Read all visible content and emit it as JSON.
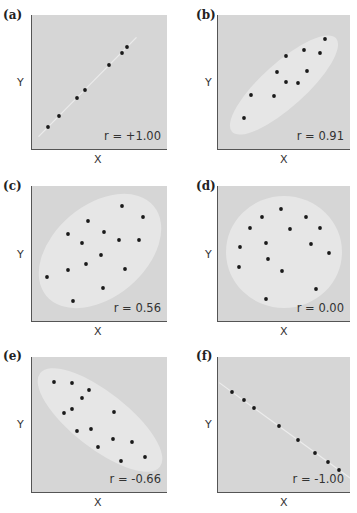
{
  "figure": {
    "colors": {
      "plot_bg": "#d6d6d6",
      "envelope": "#e6e6e6",
      "dot": "#1a1a1a",
      "axis": "#555555"
    },
    "axis_labels": {
      "x": "X",
      "y": "Y"
    }
  },
  "chart_data": [
    {
      "type": "scatter",
      "panel": "(a)",
      "annotation": "r = +1.00",
      "r": 1.0,
      "xlabel": "X",
      "ylabel": "Y",
      "envelope": "line",
      "points": [
        [
          16,
          22
        ],
        [
          27,
          33
        ],
        [
          45,
          51
        ],
        [
          53,
          59
        ],
        [
          77,
          84
        ],
        [
          90,
          96
        ],
        [
          95,
          102
        ]
      ]
    },
    {
      "type": "scatter",
      "panel": "(b)",
      "annotation": "r = 0.91",
      "r": 0.91,
      "xlabel": "X",
      "ylabel": "Y",
      "envelope": "narrow-ellipse",
      "points": [
        [
          26,
          31
        ],
        [
          33,
          54
        ],
        [
          56,
          53
        ],
        [
          59,
          77
        ],
        [
          68,
          93
        ],
        [
          68,
          67
        ],
        [
          80,
          66
        ],
        [
          86,
          99
        ],
        [
          89,
          78
        ],
        [
          102,
          96
        ],
        [
          107,
          110
        ]
      ]
    },
    {
      "type": "scatter",
      "panel": "(c)",
      "annotation": "r = 0.56",
      "r": 0.56,
      "xlabel": "X",
      "ylabel": "Y",
      "envelope": "wide-ellipse",
      "points": [
        [
          15,
          44
        ],
        [
          36,
          87
        ],
        [
          36,
          51
        ],
        [
          41,
          20
        ],
        [
          50,
          78
        ],
        [
          56,
          100
        ],
        [
          54,
          57
        ],
        [
          69,
          66
        ],
        [
          72,
          89
        ],
        [
          71,
          33
        ],
        [
          87,
          81
        ],
        [
          90,
          115
        ],
        [
          93,
          52
        ],
        [
          107,
          81
        ],
        [
          111,
          104
        ]
      ]
    },
    {
      "type": "scatter",
      "panel": "(d)",
      "annotation": "r = 0.00",
      "r": 0.0,
      "xlabel": "X",
      "ylabel": "Y",
      "envelope": "circle",
      "points": [
        [
          63,
          112
        ],
        [
          44,
          104
        ],
        [
          32,
          93
        ],
        [
          72,
          92
        ],
        [
          88,
          104
        ],
        [
          102,
          93
        ],
        [
          22,
          74
        ],
        [
          48,
          78
        ],
        [
          93,
          77
        ],
        [
          111,
          68
        ],
        [
          21,
          54
        ],
        [
          50,
          62
        ],
        [
          64,
          50
        ],
        [
          98,
          32
        ],
        [
          48,
          22
        ]
      ]
    },
    {
      "type": "scatter",
      "panel": "(e)",
      "annotation": "r = -0.66",
      "r": -0.66,
      "xlabel": "X",
      "ylabel": "Y",
      "envelope": "ellipse-descending",
      "points": [
        [
          22,
          110
        ],
        [
          40,
          109
        ],
        [
          57,
          102
        ],
        [
          50,
          94
        ],
        [
          40,
          83
        ],
        [
          32,
          79
        ],
        [
          82,
          80
        ],
        [
          45,
          61
        ],
        [
          59,
          63
        ],
        [
          81,
          53
        ],
        [
          100,
          50
        ],
        [
          66,
          45
        ],
        [
          89,
          31
        ],
        [
          113,
          35
        ]
      ]
    },
    {
      "type": "scatter",
      "panel": "(f)",
      "annotation": "r = -1.00",
      "r": -1.0,
      "xlabel": "X",
      "ylabel": "Y",
      "envelope": "line",
      "points": [
        [
          14,
          100
        ],
        [
          26,
          92
        ],
        [
          36,
          84
        ],
        [
          61,
          66
        ],
        [
          80,
          52
        ],
        [
          97,
          39
        ],
        [
          110,
          30
        ],
        [
          121,
          22
        ]
      ]
    }
  ]
}
